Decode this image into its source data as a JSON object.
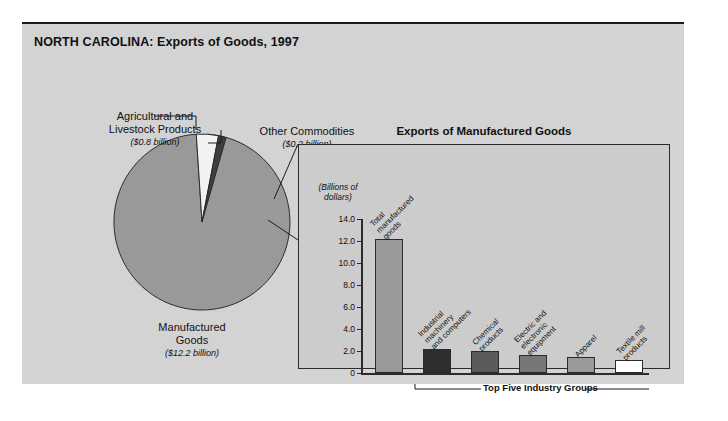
{
  "figure": {
    "title": "NORTH CAROLINA: Exports of Goods, 1997"
  },
  "pie_panel": {
    "labels": {
      "agricultural": {
        "name": "Agricultural and\nLivestock Products",
        "line1": "Agricultural and",
        "line2": "Livestock Products",
        "amount": "($0.8 billion)"
      },
      "other": {
        "line1": "Other Commodities",
        "amount": "($0.2 billion)"
      },
      "manufactured": {
        "line1": "Manufactured",
        "line2": "Goods",
        "amount": "($12.2 billion)"
      }
    }
  },
  "bar_panel": {
    "title": "Exports of Manufactured Goods",
    "axis_caption_line1": "(Billions of",
    "axis_caption_line2": "dollars)",
    "bracket_label": "Top Five Industry Groups"
  },
  "colors": {
    "page_background": "#ffffff",
    "figure_background": "#d3d3d3",
    "panel_background": "#cccccc",
    "ink": "#111111",
    "rule": "#2b2b2b",
    "pie_manufactured": "#999999",
    "pie_agricultural": "#f2f2f2",
    "pie_other": "#3d3d3d",
    "bar_total": "#999999",
    "bar_industrial": "#2e2e2e",
    "bar_chemical": "#5a5a5a",
    "bar_electric": "#777777",
    "bar_apparel": "#9a9a9a",
    "bar_textile": "#ffffff"
  },
  "chart_data": [
    {
      "type": "pie",
      "title": "NORTH CAROLINA: Exports of Goods, 1997",
      "unit": "billions of dollars",
      "categories": [
        "Manufactured Goods",
        "Agricultural and Livestock Products",
        "Other Commodities"
      ],
      "values": [
        12.2,
        0.8,
        0.2
      ],
      "value_labels": [
        "($12.2 billion)",
        "($0.8 billion)",
        "($0.2 billion)"
      ],
      "percentages": [
        92.4,
        6.1,
        1.5
      ],
      "legend": "labels with leader lines",
      "colors": [
        "#999999",
        "#f2f2f2",
        "#3d3d3d"
      ]
    },
    {
      "type": "bar",
      "title": "Exports of Manufactured Goods",
      "xlabel": "",
      "ylabel": "(Billions of dollars)",
      "ylim": [
        0,
        14.0
      ],
      "yticks": [
        0,
        2.0,
        4.0,
        6.0,
        8.0,
        10.0,
        12.0,
        14.0
      ],
      "ytick_labels": [
        "0",
        "2.0",
        "4.0",
        "6.0",
        "8.0",
        "10.0",
        "12.0",
        "14.0"
      ],
      "grid": false,
      "categories": [
        "Total manufactured goods",
        "Industrial machinery and computers",
        "Chemical products",
        "Electric and electronic equipment",
        "Apparel",
        "Textile mill products"
      ],
      "values": [
        12.2,
        2.2,
        2.0,
        1.6,
        1.5,
        1.2
      ],
      "annotation": "Top Five Industry Groups",
      "annotation_covers": [
        1,
        2,
        3,
        4,
        5
      ],
      "colors": [
        "#999999",
        "#2e2e2e",
        "#5a5a5a",
        "#777777",
        "#9a9a9a",
        "#ffffff"
      ]
    }
  ],
  "bar_labels": [
    {
      "lines": [
        "Total",
        "manufactured",
        "goods"
      ]
    },
    {
      "lines": [
        "Industrial",
        "machinery",
        "and computers"
      ]
    },
    {
      "lines": [
        "Chemical",
        "products"
      ]
    },
    {
      "lines": [
        "Electric and",
        "electronic",
        "equipment"
      ]
    },
    {
      "lines": [
        "Apparel"
      ]
    },
    {
      "lines": [
        "Textile mill",
        "products"
      ]
    }
  ],
  "y_ticks": [
    {
      "label": "14.0",
      "value": 14.0
    },
    {
      "label": "12.0",
      "value": 12.0
    },
    {
      "label": "10.0",
      "value": 10.0
    },
    {
      "label": "8.0",
      "value": 8.0
    },
    {
      "label": "6.0",
      "value": 6.0
    },
    {
      "label": "4.0",
      "value": 4.0
    },
    {
      "label": "2.0",
      "value": 2.0
    },
    {
      "label": "0",
      "value": 0
    }
  ]
}
